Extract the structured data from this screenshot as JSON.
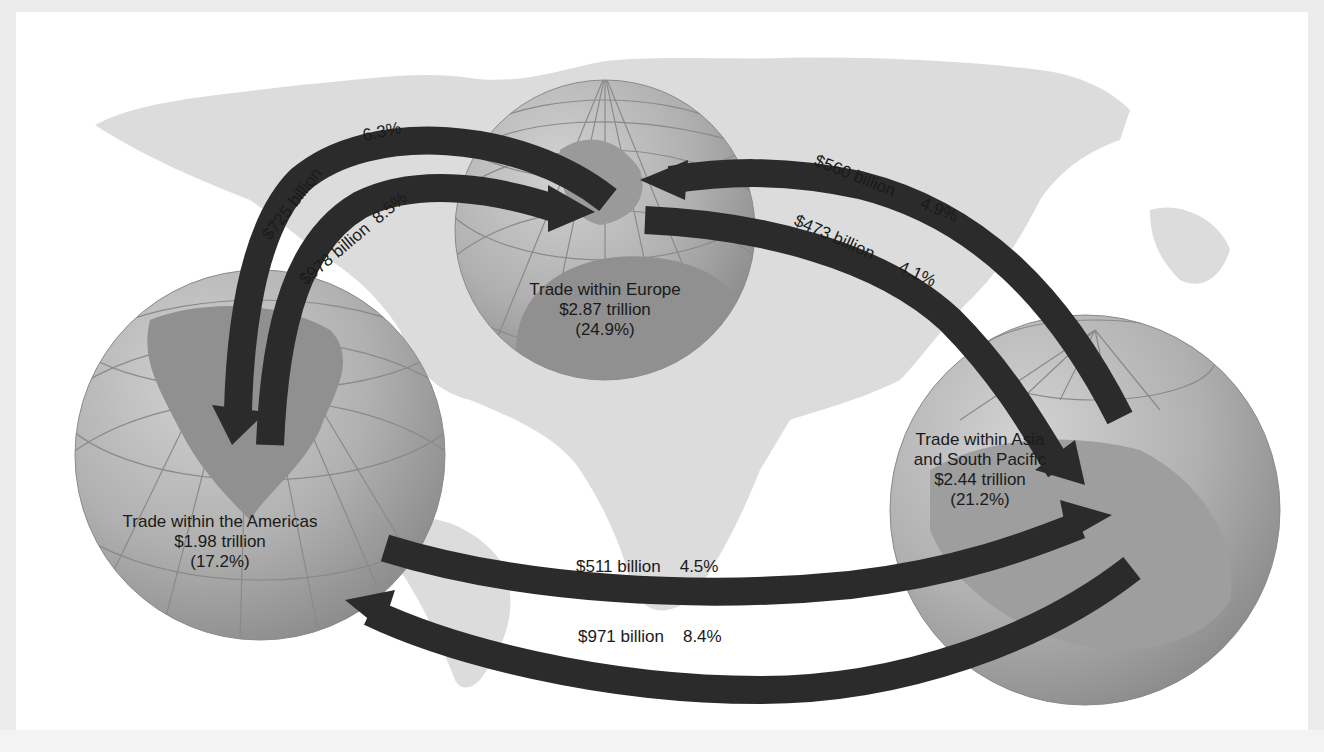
{
  "regions": {
    "americas": {
      "title": "Trade within the Americas",
      "value": "$1.98 trillion",
      "share": "(17.2%)"
    },
    "europe": {
      "title": "Trade within Europe",
      "value": "$2.87 trillion",
      "share": "(24.9%)"
    },
    "asia": {
      "title_line1": "Trade within Asia",
      "title_line2": "and South Pacific",
      "value": "$2.44 trillion",
      "share": "(21.2%)"
    }
  },
  "flows": [
    {
      "id": "europe_to_americas",
      "from": "Europe",
      "to": "Americas",
      "amount": "$725 billion",
      "share": "6.3%"
    },
    {
      "id": "americas_to_europe",
      "from": "Americas",
      "to": "Europe",
      "amount": "$978 billion",
      "share": "8.5%"
    },
    {
      "id": "asia_to_europe",
      "from": "Asia and South Pacific",
      "to": "Europe",
      "amount": "$560 billion",
      "share": "4.9%"
    },
    {
      "id": "europe_to_asia",
      "from": "Europe",
      "to": "Asia and South Pacific",
      "amount": "$473 billion",
      "share": "4.1%"
    },
    {
      "id": "americas_to_asia",
      "from": "Americas",
      "to": "Asia and South Pacific",
      "amount": "$511 billion",
      "share": "4.5%"
    },
    {
      "id": "asia_to_americas",
      "from": "Asia and South Pacific",
      "to": "Americas",
      "amount": "$971 billion",
      "share": "8.4%"
    }
  ],
  "colors": {
    "arrow": "#2b2b2b",
    "globe": "#a9a9a9",
    "land": "#8f8f8f",
    "background_map": "#d9d9d9"
  }
}
